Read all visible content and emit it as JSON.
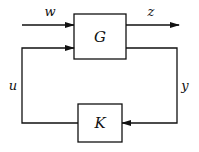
{
  "diagram": {
    "type": "feedback-block-diagram",
    "blocks": [
      {
        "id": "G",
        "label": "G"
      },
      {
        "id": "K",
        "label": "K"
      }
    ],
    "signals": {
      "w": "w",
      "z": "z",
      "u": "u",
      "y": "y"
    },
    "edges": [
      {
        "from": "external",
        "to": "G",
        "label": "w"
      },
      {
        "from": "G",
        "to": "external",
        "label": "z"
      },
      {
        "from": "G",
        "to": "K",
        "label": "y"
      },
      {
        "from": "K",
        "to": "G",
        "label": "u"
      }
    ],
    "colors": {
      "line": "#111111",
      "background": "#ffffff"
    }
  }
}
